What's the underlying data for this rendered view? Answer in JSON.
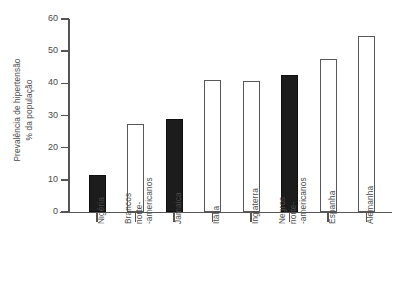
{
  "chart_data": {
    "type": "bar",
    "title": "",
    "xlabel": "",
    "ylabel": "Prevalência de hipertensão\n% da população",
    "ylim": [
      0,
      60
    ],
    "yticks": [
      0,
      10,
      20,
      30,
      40,
      50,
      60
    ],
    "ytick_labels": [
      "0",
      "10",
      "20",
      "30",
      "40",
      "50",
      "60"
    ],
    "grid": false,
    "legend": "none",
    "categories": [
      "Nigéria",
      "Brancos\nnorte-\n-americanos",
      "Jamaica",
      "Itália",
      "Inglaterra",
      "Negros\nnorte-\n-americanos",
      "Espanha",
      "Alemanha"
    ],
    "values": [
      11.5,
      27.5,
      28.8,
      41.0,
      40.8,
      42.5,
      47.6,
      54.8
    ],
    "bar_styles": [
      "filled",
      "open",
      "filled",
      "open",
      "open",
      "filled",
      "open",
      "open"
    ],
    "colors": {
      "filled_bar": "#1c1c1c",
      "open_bar": "#ffffff",
      "bar_edge": "#585858",
      "axis": "#555555",
      "text": "#4a4a4a",
      "background": "#ffffff"
    }
  }
}
